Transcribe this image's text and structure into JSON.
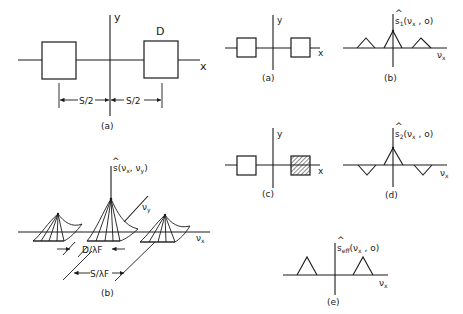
{
  "panels": {
    "left_a": {
      "caption": "(a)",
      "axis_x": "x",
      "axis_y": "y",
      "box_label": "D",
      "dim_left": "S/2",
      "dim_right": "S/2"
    },
    "left_b": {
      "caption": "(b)",
      "function_label": "ŝ(νx, νy)",
      "axis_vx": "νx",
      "axis_vy": "νy",
      "dim_d": "D/λF",
      "dim_s": "S/λF"
    },
    "right_a": {
      "caption": "(a)",
      "axis_x": "x",
      "axis_y": "y"
    },
    "right_b": {
      "caption": "(b)",
      "function_label": "ŝ1(νx , o)",
      "axis": "νx"
    },
    "right_c": {
      "caption": "(c)",
      "axis_x": "x",
      "axis_y": "y",
      "note": "right aperture hatched"
    },
    "right_d": {
      "caption": "(d)",
      "function_label": "ŝ2(νx , o)",
      "axis": "νx"
    },
    "right_e": {
      "caption": "(e)",
      "function_label": "ŝeff(νx , o)",
      "axis": "νx"
    }
  },
  "text": {
    "a_caption": "(a)",
    "a_x": "x",
    "a_y": "y",
    "a_D": "D",
    "a_s2_left": "S/2",
    "a_s2_right": "S/2",
    "b_caption": "(b)",
    "b_s": "s",
    "b_hat": "^",
    "b_args": "(ν",
    "b_sub_x": "x",
    "b_comma": ", ν",
    "b_sub_y": "y",
    "b_close": ")",
    "b_vy": "ν",
    "b_vy_sub": "y",
    "b_vx": "ν",
    "b_vx_sub": "x",
    "b_dlf": "D/λF",
    "b_slf": "S/λF",
    "ra_caption": "(a)",
    "ra_x": "x",
    "ra_y": "y",
    "rb_caption": "(b)",
    "rb_s": "s",
    "rb_sub": "1",
    "rb_args": "(ν",
    "rb_argx": "x",
    "rb_rest": " , o)",
    "rb_axis": "ν",
    "rb_axis_sub": "x",
    "rc_caption": "(c)",
    "rc_x": "x",
    "rc_y": "y",
    "rd_caption": "(d)",
    "rd_s": "s",
    "rd_sub": "2",
    "rd_args": "(ν",
    "rd_argx": "x",
    "rd_rest": " , o)",
    "rd_axis": "ν",
    "rd_axis_sub": "x",
    "re_caption": "(e)",
    "re_s": "s",
    "re_sub": "eff",
    "re_args": "(ν",
    "re_argx": "x",
    "re_rest": " , o)",
    "re_axis": "ν",
    "re_axis_sub": "x"
  }
}
